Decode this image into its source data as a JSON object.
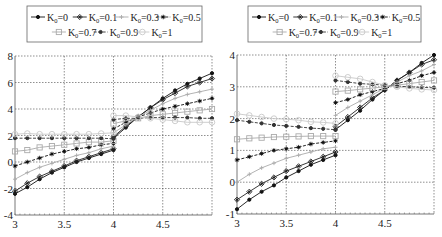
{
  "chart_data": [
    {
      "type": "line",
      "title": "",
      "xlabel": "",
      "ylabel": "",
      "xlim": [
        3,
        5
      ],
      "ylim": [
        -4,
        8
      ],
      "xticks": [
        3,
        3.5,
        4,
        4.5
      ],
      "xtick_labels": [
        "3",
        "3.5",
        "4",
        "4.5"
      ],
      "yticks": [
        -4,
        -2,
        0,
        2,
        4,
        6,
        8
      ],
      "ytick_labels": [
        "-4",
        "-2",
        "0",
        "2",
        "4",
        "6",
        "8"
      ],
      "grid": true,
      "legend_position": "top",
      "x_left": [
        3,
        3.125,
        3.25,
        3.375,
        3.5,
        3.625,
        3.75,
        3.875,
        4
      ],
      "x_right": [
        4,
        4.125,
        4.25,
        4.375,
        4.5,
        4.625,
        4.75,
        4.875,
        5
      ],
      "series": [
        {
          "name": "K_0=0",
          "legend_main": "K",
          "legend_sub": "0",
          "legend_val": "=0",
          "marker": "dot",
          "color": "#111111",
          "dash": "",
          "left": [
            -2.4,
            -1.9,
            -1.3,
            -0.8,
            -0.4,
            0.0,
            0.3,
            0.6,
            0.9
          ],
          "right": [
            1.8,
            2.6,
            3.4,
            4.1,
            4.8,
            5.4,
            5.9,
            6.3,
            6.7
          ]
        },
        {
          "name": "K_0=0.1",
          "legend_main": "K",
          "legend_sub": "0",
          "legend_val": "=0.1",
          "marker": "diamond",
          "color": "#222222",
          "dash": "",
          "left": [
            -2.2,
            -1.6,
            -1.1,
            -0.7,
            -0.3,
            0.1,
            0.4,
            0.7,
            1.0
          ],
          "right": [
            1.9,
            2.7,
            3.4,
            4.1,
            4.7,
            5.2,
            5.7,
            6.0,
            6.3
          ]
        },
        {
          "name": "K_0=0.3",
          "legend_main": "K",
          "legend_sub": "0",
          "legend_val": "=0.3",
          "marker": "plus",
          "color": "#aaaaaa",
          "dash": "",
          "left": [
            -1.3,
            -0.8,
            -0.4,
            -0.1,
            0.2,
            0.5,
            0.7,
            1.0,
            1.2
          ],
          "right": [
            2.2,
            2.8,
            3.4,
            3.9,
            4.4,
            4.8,
            5.1,
            5.3,
            5.5
          ]
        },
        {
          "name": "K_0=0.5",
          "legend_main": "K",
          "legend_sub": "0",
          "legend_val": "=0.5",
          "marker": "star",
          "color": "#111111",
          "dash": "3 1.5",
          "left": [
            -0.3,
            0.0,
            0.3,
            0.6,
            0.8,
            1.0,
            1.1,
            1.3,
            1.4
          ],
          "right": [
            2.5,
            3.0,
            3.4,
            3.7,
            4.0,
            4.2,
            4.4,
            4.6,
            4.8
          ]
        },
        {
          "name": "K_0=0.7",
          "legend_main": "K",
          "legend_sub": "0",
          "legend_val": "=0.7",
          "marker": "square",
          "color": "#aaaaaa",
          "dash": "",
          "left": [
            0.8,
            0.9,
            1.1,
            1.2,
            1.3,
            1.4,
            1.5,
            1.5,
            1.6
          ],
          "right": [
            2.9,
            3.1,
            3.3,
            3.5,
            3.6,
            3.7,
            3.8,
            3.9,
            4.0
          ]
        },
        {
          "name": "K_0=0.9",
          "legend_main": "K",
          "legend_sub": "0",
          "legend_val": "=0.9",
          "marker": "dot",
          "color": "#333333",
          "dash": "3 1.5",
          "left": [
            1.8,
            1.8,
            1.8,
            1.8,
            1.8,
            1.8,
            1.8,
            1.8,
            1.75
          ],
          "right": [
            3.2,
            3.3,
            3.3,
            3.35,
            3.35,
            3.35,
            3.35,
            3.3,
            3.3
          ]
        },
        {
          "name": "K_0=1",
          "legend_main": "K",
          "legend_sub": "0",
          "legend_val": "=1",
          "marker": "circle",
          "color": "#c8c8c8",
          "dash": "",
          "left": [
            2.1,
            2.15,
            2.1,
            2.1,
            2.1,
            2.1,
            2.1,
            2.15,
            2.2
          ],
          "right": [
            3.5,
            3.5,
            3.4,
            3.3,
            3.2,
            3.1,
            3.0,
            3.0,
            3.0
          ]
        }
      ]
    },
    {
      "type": "line",
      "title": "",
      "xlabel": "",
      "ylabel": "",
      "xlim": [
        3,
        5
      ],
      "ylim": [
        -1,
        4
      ],
      "xticks": [
        3,
        3.5,
        4,
        4.5
      ],
      "xtick_labels": [
        "3",
        "3.5",
        "4",
        "4.5"
      ],
      "yticks": [
        -1,
        0,
        1,
        2,
        3,
        4
      ],
      "ytick_labels": [
        "-1",
        "0",
        "1",
        "2",
        "3",
        "4"
      ],
      "grid": true,
      "legend_position": "top",
      "x_left": [
        3,
        3.125,
        3.25,
        3.375,
        3.5,
        3.625,
        3.75,
        3.875,
        4
      ],
      "x_right": [
        4,
        4.125,
        4.25,
        4.375,
        4.5,
        4.625,
        4.75,
        4.875,
        5
      ],
      "series": [
        {
          "name": "K_0=0",
          "legend_main": "K",
          "legend_sub": "0",
          "legend_val": "=0",
          "marker": "dot",
          "color": "#111111",
          "dash": "",
          "left": [
            -0.85,
            -0.55,
            -0.3,
            -0.1,
            0.15,
            0.35,
            0.55,
            0.7,
            0.85
          ],
          "right": [
            1.65,
            1.95,
            2.25,
            2.6,
            2.9,
            3.2,
            3.45,
            3.75,
            4.0
          ]
        },
        {
          "name": "K_0=0.1",
          "legend_main": "K",
          "legend_sub": "0",
          "legend_val": "=0.1",
          "marker": "diamond",
          "color": "#222222",
          "dash": "",
          "left": [
            -0.55,
            -0.3,
            -0.05,
            0.15,
            0.35,
            0.5,
            0.65,
            0.8,
            0.95
          ],
          "right": [
            1.75,
            2.05,
            2.35,
            2.65,
            2.9,
            3.2,
            3.45,
            3.7,
            3.85
          ]
        },
        {
          "name": "K_0=0.3",
          "legend_main": "K",
          "legend_sub": "0",
          "legend_val": "=0.3",
          "marker": "plus",
          "color": "#aaaaaa",
          "dash": "",
          "left": [
            0.0,
            0.25,
            0.45,
            0.6,
            0.75,
            0.85,
            0.95,
            1.05,
            1.1
          ],
          "right": [
            2.1,
            2.35,
            2.55,
            2.75,
            2.95,
            3.15,
            3.35,
            3.5,
            3.7
          ]
        },
        {
          "name": "K_0=0.5",
          "legend_main": "K",
          "legend_sub": "0",
          "legend_val": "=0.5",
          "marker": "star",
          "color": "#111111",
          "dash": "3 1.5",
          "left": [
            0.7,
            0.8,
            0.9,
            1.0,
            1.05,
            1.1,
            1.2,
            1.25,
            1.3
          ],
          "right": [
            2.5,
            2.6,
            2.75,
            2.85,
            2.95,
            3.1,
            3.2,
            3.35,
            3.45
          ]
        },
        {
          "name": "K_0=0.7",
          "legend_main": "K",
          "legend_sub": "0",
          "legend_val": "=0.7",
          "marker": "square",
          "color": "#aaaaaa",
          "dash": "",
          "left": [
            1.35,
            1.38,
            1.4,
            1.42,
            1.43,
            1.44,
            1.45,
            1.45,
            1.45
          ],
          "right": [
            2.85,
            2.88,
            2.92,
            2.96,
            3.0,
            3.05,
            3.1,
            3.15,
            3.2
          ]
        },
        {
          "name": "K_0=0.9",
          "legend_main": "K",
          "legend_sub": "0",
          "legend_val": "=0.9",
          "marker": "dot",
          "color": "#333333",
          "dash": "3 1.5",
          "left": [
            1.95,
            1.9,
            1.85,
            1.8,
            1.77,
            1.74,
            1.7,
            1.68,
            1.65
          ],
          "right": [
            3.2,
            3.15,
            3.1,
            3.08,
            3.05,
            3.02,
            3.0,
            2.98,
            2.97
          ]
        },
        {
          "name": "K_0=1",
          "legend_main": "K",
          "legend_sub": "0",
          "legend_val": "=1",
          "marker": "circle",
          "color": "#c8c8c8",
          "dash": "",
          "left": [
            2.15,
            2.1,
            2.05,
            2.0,
            1.98,
            1.95,
            1.9,
            1.88,
            1.85
          ],
          "right": [
            3.35,
            3.3,
            3.25,
            3.15,
            3.05,
            3.0,
            2.95,
            2.92,
            2.9
          ]
        }
      ]
    }
  ]
}
